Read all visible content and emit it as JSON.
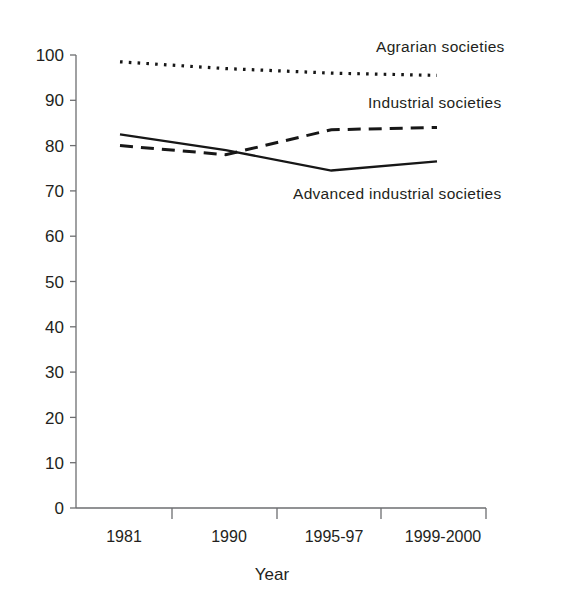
{
  "chart_data": {
    "type": "line",
    "title": "",
    "subtitle": "",
    "xlabel": "Year",
    "ylabel": "",
    "categories": [
      "1981",
      "1990",
      "1995-97",
      "1999-2000"
    ],
    "ylim": [
      0,
      100
    ],
    "yticks": [
      "0",
      "10",
      "20",
      "30",
      "40",
      "50",
      "60",
      "70",
      "80",
      "90",
      "100"
    ],
    "ytick_values": [
      0,
      10,
      20,
      30,
      40,
      50,
      60,
      70,
      80,
      90,
      100
    ],
    "grid": false,
    "legend_position": "inline-annotations",
    "series": [
      {
        "name": "Agrarian societies",
        "style": "dotted",
        "color": "#171717",
        "values": [
          98.5,
          97.0,
          96.0,
          95.5
        ]
      },
      {
        "name": "Industrial societies",
        "style": "dashed",
        "color": "#171717",
        "values": [
          80.0,
          78.0,
          83.5,
          84.0
        ]
      },
      {
        "name": "Advanced industrial societies",
        "style": "solid",
        "color": "#171717",
        "values": [
          82.5,
          79.0,
          74.5,
          76.5
        ]
      }
    ],
    "annotations": [
      {
        "text": "Agrarian societies",
        "x": 376,
        "y": 52
      },
      {
        "text": "Industrial societies",
        "x": 368,
        "y": 108
      },
      {
        "text": "Advanced industrial societies",
        "x": 293,
        "y": 199
      }
    ]
  }
}
